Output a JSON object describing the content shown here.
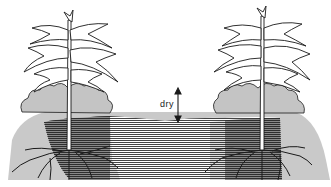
{
  "diagram": {
    "labels": {
      "dry": "dry"
    },
    "colors": {
      "background": "#ffffff",
      "dry_soil": "#c8c8c8",
      "moist_soil_stripes": "#4a4a4a",
      "bush": "#c4c4c4",
      "outline": "#1a1a1a"
    },
    "elements": [
      {
        "name": "left-maize-plant",
        "stem_x": 69
      },
      {
        "name": "right-maize-plant",
        "stem_x": 262
      },
      {
        "name": "dry-arrow",
        "x": 178,
        "y_top": 89,
        "y_bottom": 121
      }
    ]
  }
}
